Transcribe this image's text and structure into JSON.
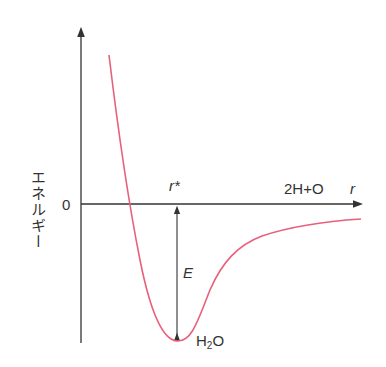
{
  "diagram": {
    "type": "potential-energy-curve",
    "y_axis_label": "エネルギー",
    "zero_label": "0",
    "x_axis_label": "r",
    "equilibrium_label": "r*",
    "dissociated_label": "2H+O",
    "depth_label": "E",
    "molecule_label_main": "H",
    "molecule_label_sub": "2",
    "molecule_label_tail": "O",
    "colors": {
      "axis": "#333333",
      "curve": "#e8607a",
      "text": "#333333"
    }
  }
}
